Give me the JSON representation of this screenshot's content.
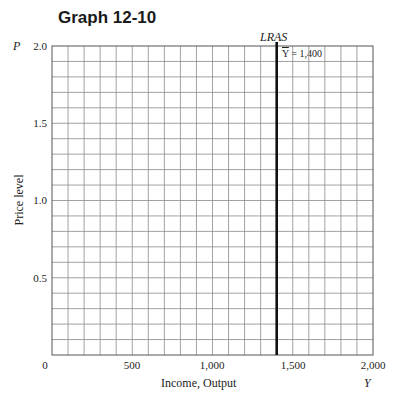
{
  "title": "Graph 12-10",
  "chart_data": {
    "type": "line",
    "title": "Graph 12-10",
    "xlabel": "Income, Output",
    "x_variable": "Y",
    "ylabel": "Price level",
    "y_variable": "P",
    "xlim": [
      0,
      2000
    ],
    "ylim": [
      0,
      2.0
    ],
    "x_ticks": [
      "0",
      "500",
      "1,000",
      "1,500",
      "2,000"
    ],
    "y_ticks": [
      "0.5",
      "1.0",
      "1.5",
      "2.0"
    ],
    "grid": true,
    "grid_x_step": 100,
    "grid_y_step": 0.1,
    "series": [
      {
        "name": "LRAS",
        "kind": "vertical",
        "x": [
          1400,
          1400
        ],
        "y": [
          0,
          2.0
        ],
        "color": "#111111"
      }
    ],
    "annotations": [
      {
        "text": "LRAS",
        "x": 1400,
        "y": 2.0
      },
      {
        "text": "Y̅ = 1,400",
        "x": 1400,
        "y": 1.95
      }
    ]
  },
  "labels": {
    "y_var": "P",
    "x_var": "Y",
    "y_axis_title": "Price level",
    "x_axis_title": "Income, Output",
    "lras": "LRAS",
    "ybar_symbol": "Y",
    "ybar_value": " = 1,400",
    "origin": "0"
  },
  "colors": {
    "grid": "#8a8a8a",
    "line": "#111111"
  }
}
